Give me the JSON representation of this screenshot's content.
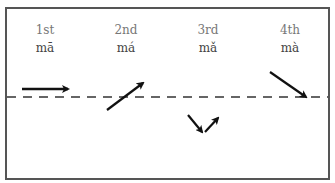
{
  "diagram": {
    "tones": [
      {
        "ordinal": "1st",
        "syllable": "mā",
        "contour": "level"
      },
      {
        "ordinal": "2nd",
        "syllable": "má",
        "contour": "rising"
      },
      {
        "ordinal": "3rd",
        "syllable": "mǎ",
        "contour": "falling-rising"
      },
      {
        "ordinal": "4th",
        "syllable": "mà",
        "contour": "falling"
      }
    ],
    "reference_line": "dashed",
    "colors": {
      "border": "#555555",
      "arrow": "#111111",
      "ordinal_text": "#777777",
      "syllable_text": "#444444"
    }
  }
}
